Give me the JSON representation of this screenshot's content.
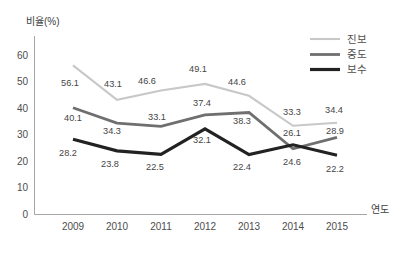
{
  "chart_data": {
    "type": "line",
    "title": "",
    "xlabel": "연도",
    "ylabel": "비율(%)",
    "categories": [
      "2009",
      "2010",
      "2011",
      "2012",
      "2013",
      "2014",
      "2015"
    ],
    "y_ticks": [
      60,
      50,
      40,
      30,
      20,
      10,
      0
    ],
    "ylim": [
      0,
      67
    ],
    "grid": false,
    "legend_position": "top-right",
    "series": [
      {
        "name": "진보",
        "slug": "progressive",
        "color": "#c8c8c8",
        "stroke_width": 2.1,
        "values": [
          56.1,
          43.1,
          46.6,
          49.1,
          44.6,
          33.3,
          34.4
        ],
        "label_offsets": [
          [
            -3,
            18
          ],
          [
            -4,
            -16
          ],
          [
            -14,
            -10
          ],
          [
            -7,
            -15
          ],
          [
            -12,
            -14
          ],
          [
            -1,
            -14
          ],
          [
            -3,
            -13
          ]
        ]
      },
      {
        "name": "중도",
        "slug": "moderate",
        "color": "#6f6f6f",
        "stroke_width": 2.8,
        "values": [
          40.1,
          34.3,
          33.1,
          37.4,
          38.3,
          24.6,
          28.9
        ],
        "label_offsets": [
          [
            0,
            10
          ],
          [
            -5,
            8
          ],
          [
            -4,
            -9
          ],
          [
            -3,
            -12
          ],
          [
            -7,
            8
          ],
          [
            -1,
            13
          ],
          [
            -2,
            -6
          ]
        ]
      },
      {
        "name": "보수",
        "slug": "conservative",
        "color": "#222222",
        "stroke_width": 3.2,
        "values": [
          28.2,
          23.8,
          22.5,
          32.1,
          22.4,
          26.1,
          22.2
        ],
        "label_offsets": [
          [
            -5,
            14
          ],
          [
            -7,
            13
          ],
          [
            -6,
            13
          ],
          [
            -3,
            11
          ],
          [
            -7,
            12
          ],
          [
            -1,
            -12
          ],
          [
            -2,
            14
          ]
        ]
      }
    ]
  }
}
